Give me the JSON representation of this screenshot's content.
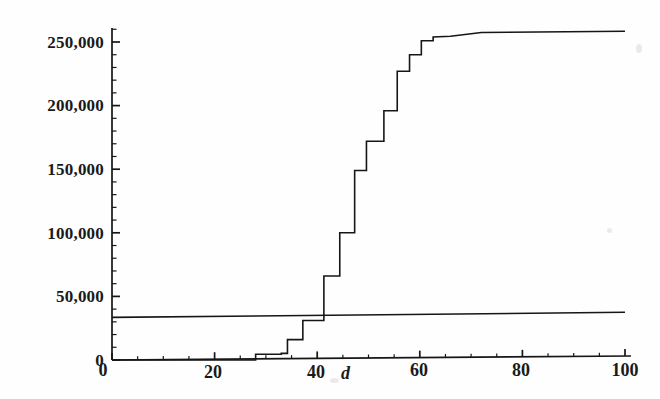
{
  "figure": {
    "background_color": "#fefefe",
    "ink_color": "#161616",
    "width": 660,
    "height": 399
  },
  "axes": {
    "x_axis_title": "d",
    "y_axis_title": "",
    "x_tick_labels": [
      "0",
      "20",
      "40",
      "60",
      "80",
      "100"
    ],
    "y_tick_labels": [
      "0",
      "50,000",
      "100,000",
      "150,000",
      "200,000",
      "250,000"
    ],
    "x_minor_tick_interval": 5,
    "y_minor_tick_interval": 10000
  },
  "chart_data": {
    "type": "line",
    "title": "",
    "subtitle": "",
    "xlabel": "d",
    "ylabel": "",
    "xlim": [
      0,
      100
    ],
    "ylim": [
      0,
      270000
    ],
    "x_ticks": [
      0,
      20,
      40,
      60,
      80,
      100
    ],
    "y_ticks": [
      0,
      50000,
      100000,
      150000,
      200000,
      250000
    ],
    "grid": false,
    "legend": "none",
    "series": [
      {
        "name": "cumulative-step-curve",
        "style": "step",
        "points": [
          [
            0,
            0
          ],
          [
            28,
            0
          ],
          [
            28,
            4500
          ],
          [
            33,
            4500
          ],
          [
            33,
            5200
          ],
          [
            34.2,
            5200
          ],
          [
            34.2,
            16000
          ],
          [
            37.2,
            16000
          ],
          [
            37.2,
            31000
          ],
          [
            41.3,
            31000
          ],
          [
            41.3,
            66000
          ],
          [
            44.4,
            66000
          ],
          [
            44.4,
            100000
          ],
          [
            47.3,
            100000
          ],
          [
            47.3,
            149000
          ],
          [
            49.6,
            149000
          ],
          [
            49.6,
            172000
          ],
          [
            53.0,
            172000
          ],
          [
            53.0,
            196000
          ],
          [
            55.6,
            196000
          ],
          [
            55.6,
            227000
          ],
          [
            58.0,
            227000
          ],
          [
            58.0,
            240000
          ],
          [
            60.3,
            240000
          ],
          [
            60.3,
            251000
          ],
          [
            62.6,
            251000
          ],
          [
            62.6,
            254000
          ],
          [
            66.0,
            254500
          ],
          [
            72.0,
            257500
          ],
          [
            100,
            258500
          ]
        ]
      },
      {
        "name": "reference-line",
        "style": "line",
        "points": [
          [
            0,
            33500
          ],
          [
            100,
            37500
          ]
        ]
      }
    ]
  }
}
